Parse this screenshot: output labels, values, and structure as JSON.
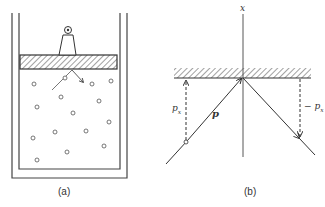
{
  "figure_a": {
    "caption": "(a)",
    "description": "Gas in a cylinder with a weighted piston; molecule colliding with piston"
  },
  "figure_b": {
    "caption": "(b)",
    "axis_label": "x",
    "momentum_label": "p",
    "incoming_component_label": "p",
    "incoming_component_subscript": "x",
    "outgoing_component_label": "− p",
    "outgoing_component_subscript": "x"
  }
}
